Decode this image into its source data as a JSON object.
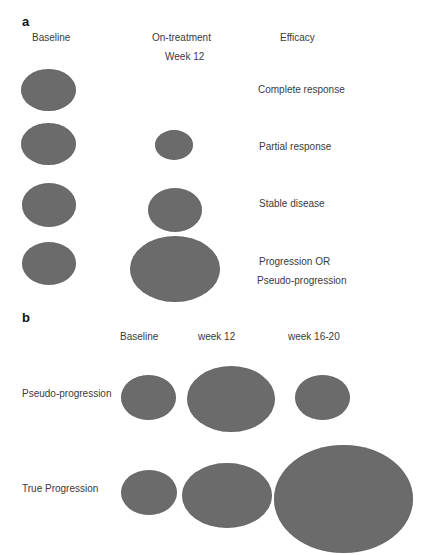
{
  "panel_a": {
    "label": "a",
    "headers": {
      "baseline": "Baseline",
      "on_treatment": "On-treatment",
      "week": "Week 12",
      "efficacy": "Efficacy"
    },
    "rows": [
      {
        "outcome": "Complete response",
        "baseline": {
          "x": 21,
          "y": 69,
          "w": 55,
          "h": 42
        },
        "week12": null
      },
      {
        "outcome": "Partial response",
        "baseline": {
          "x": 21,
          "y": 123,
          "w": 55,
          "h": 42
        },
        "week12": {
          "x": 155,
          "y": 130,
          "w": 38,
          "h": 30
        }
      },
      {
        "outcome": "Stable disease",
        "baseline": {
          "x": 22,
          "y": 183,
          "w": 54,
          "h": 44
        },
        "week12": {
          "x": 148,
          "y": 188,
          "w": 54,
          "h": 44
        }
      },
      {
        "outcome_line1": "Progression OR",
        "outcome_line2": "Pseudo-progression",
        "baseline": {
          "x": 22,
          "y": 242,
          "w": 54,
          "h": 43
        },
        "week12": {
          "x": 130,
          "y": 236,
          "w": 90,
          "h": 66
        }
      }
    ]
  },
  "panel_b": {
    "label": "b",
    "headers": {
      "baseline": "Baseline",
      "week12": "week 12",
      "week16_20": "week 16-20"
    },
    "rows": [
      {
        "label": "Pseudo-progression",
        "baseline": {
          "x": 121,
          "y": 375,
          "w": 55,
          "h": 45
        },
        "week12": {
          "x": 187,
          "y": 366,
          "w": 88,
          "h": 66
        },
        "week16_20": {
          "x": 295,
          "y": 375,
          "w": 55,
          "h": 45
        }
      },
      {
        "label": "True Progression",
        "baseline": {
          "x": 121,
          "y": 470,
          "w": 56,
          "h": 45
        },
        "week12": {
          "x": 182,
          "y": 463,
          "w": 90,
          "h": 65
        },
        "week16_20": {
          "x": 274,
          "y": 445,
          "w": 139,
          "h": 108
        }
      }
    ]
  },
  "colors": {
    "lesion": "#6b6b6b",
    "text": "#3a3a3a",
    "background": "#ffffff"
  }
}
